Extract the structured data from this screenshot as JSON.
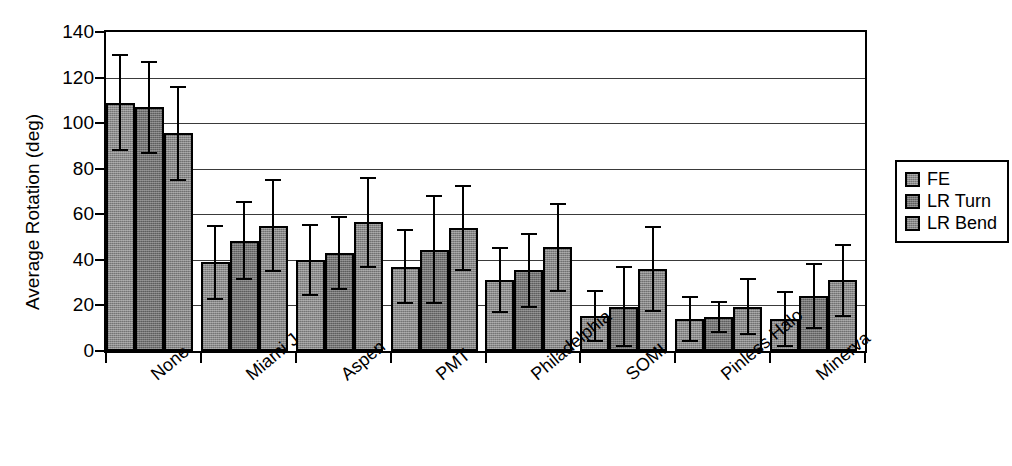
{
  "chart_data": {
    "type": "bar",
    "title": "",
    "xlabel": "",
    "ylabel": "Average Rotation (deg)",
    "ylim": [
      0,
      140
    ],
    "yticks": [
      0,
      20,
      40,
      60,
      80,
      100,
      120,
      140
    ],
    "ytick_labels": [
      "0",
      "20",
      "40",
      "60",
      "80",
      "100",
      "120",
      "140"
    ],
    "grid": true,
    "grid_axis": "y",
    "legend_position": "right-outside",
    "error_bars": "symmetric-standard-deviation",
    "categories": [
      "None",
      "Miami J",
      "Aspen",
      "PMT",
      "Philadelphia",
      "SOMI",
      "Pinless Halo",
      "Minerva"
    ],
    "series": [
      {
        "name": "FE",
        "color": "#8a8a8a",
        "values": [
          109,
          39,
          40,
          37,
          31,
          15.5,
          14,
          14
        ],
        "errors": [
          21,
          16,
          15.5,
          16,
          14,
          11,
          9.5,
          12
        ]
      },
      {
        "name": "LR Turn",
        "color": "#727272",
        "values": [
          107,
          48.5,
          43,
          44.5,
          35.5,
          19.5,
          15,
          24
        ],
        "errors": [
          20,
          17,
          16,
          23.5,
          16,
          17.5,
          6.5,
          14
        ]
      },
      {
        "name": "LR Bend",
        "color": "#868686",
        "values": [
          95.5,
          55,
          56.5,
          54,
          45.5,
          36,
          19.5,
          31
        ]
      }
    ]
  },
  "legend": {
    "items": [
      {
        "label": "FE"
      },
      {
        "label": "LR Turn"
      },
      {
        "label": "LR Bend"
      }
    ]
  },
  "axes": {
    "y_title": "Average Rotation (deg)"
  },
  "errors_series3": [
    20.5,
    20,
    19.5,
    18.5,
    19,
    18.5,
    12,
    15.5
  ]
}
